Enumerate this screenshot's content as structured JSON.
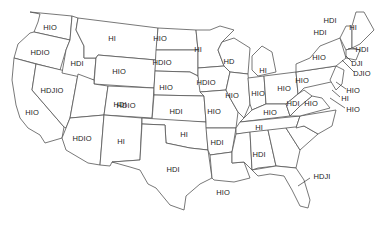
{
  "map": {
    "type": "US states choropleth-style label map",
    "states": [
      {
        "id": "WA",
        "label": "HIO",
        "x": 50,
        "y": 27
      },
      {
        "id": "OR",
        "label": "HDIO",
        "x": 40,
        "y": 52
      },
      {
        "id": "ID",
        "label": "HDI",
        "x": 77,
        "y": 63
      },
      {
        "id": "MT",
        "label": "HI",
        "x": 112,
        "y": 38
      },
      {
        "id": "WY",
        "label": "HIO",
        "x": 119,
        "y": 71
      },
      {
        "id": "ND",
        "label": "HIO",
        "x": 160,
        "y": 38
      },
      {
        "id": "SD",
        "label": "HDIO",
        "x": 162,
        "y": 62
      },
      {
        "id": "NE",
        "label": "HIO",
        "x": 166,
        "y": 87
      },
      {
        "id": "MN",
        "label": "HI",
        "x": 198,
        "y": 49
      },
      {
        "id": "WI",
        "label": "HD",
        "x": 229,
        "y": 61
      },
      {
        "id": "MI",
        "label": "HI",
        "x": 263,
        "y": 70
      },
      {
        "id": "IA",
        "label": "HDIO",
        "x": 206,
        "y": 82
      },
      {
        "id": "IL",
        "label": "HIO",
        "x": 232,
        "y": 95
      },
      {
        "id": "IN",
        "label": "HIO",
        "x": 258,
        "y": 93
      },
      {
        "id": "OH",
        "label": "HIO",
        "x": 284,
        "y": 88
      },
      {
        "id": "NV",
        "label": "HDJIO",
        "x": 52,
        "y": 90
      },
      {
        "id": "UT",
        "label": "HDI",
        "x": 120,
        "y": 104
      },
      {
        "id": "CO",
        "label": "HDIO",
        "x": 126,
        "y": 105
      },
      {
        "id": "KS",
        "label": "HDI",
        "x": 176,
        "y": 111
      },
      {
        "id": "MO",
        "label": "HIO",
        "x": 214,
        "y": 111
      },
      {
        "id": "KY",
        "label": "HIO",
        "x": 270,
        "y": 112
      },
      {
        "id": "CA",
        "label": "HIO",
        "x": 32,
        "y": 112
      },
      {
        "id": "AZ",
        "label": "HDIO",
        "x": 82,
        "y": 138
      },
      {
        "id": "NM",
        "label": "HI",
        "x": 121,
        "y": 141
      },
      {
        "id": "OK",
        "label": "HI",
        "x": 184,
        "y": 134
      },
      {
        "id": "TN",
        "label": "HI",
        "x": 259,
        "y": 127
      },
      {
        "id": "AR",
        "label": "HDI",
        "x": 217,
        "y": 142
      },
      {
        "id": "TX",
        "label": "HDI",
        "x": 173,
        "y": 169
      },
      {
        "id": "AL",
        "label": "HDI",
        "x": 259,
        "y": 154
      },
      {
        "id": "LA",
        "label": "HIO",
        "x": 223,
        "y": 192
      },
      {
        "id": "FL",
        "label": "HDJI",
        "x": 322,
        "y": 176
      },
      {
        "id": "PA",
        "label": "HIO",
        "x": 302,
        "y": 80
      },
      {
        "id": "NY",
        "label": "HIO",
        "x": 319,
        "y": 57
      },
      {
        "id": "WV",
        "label": "HDI",
        "x": 293,
        "y": 103
      },
      {
        "id": "VA",
        "label": "HIO",
        "x": 311,
        "y": 103
      },
      {
        "id": "ME",
        "label": "HI",
        "x": 353,
        "y": 27
      },
      {
        "id": "VT",
        "label": "HDI",
        "x": 330,
        "y": 20
      },
      {
        "id": "NH",
        "label": "HDI",
        "x": 320,
        "y": 32
      },
      {
        "id": "MA",
        "label": "HDI",
        "x": 362,
        "y": 49
      },
      {
        "id": "RI",
        "label": "DJI",
        "x": 357,
        "y": 63
      },
      {
        "id": "CT",
        "label": "DJIO",
        "x": 362,
        "y": 73
      },
      {
        "id": "NJ",
        "label": "HIO",
        "x": 353,
        "y": 90
      },
      {
        "id": "DE",
        "label": "HI",
        "x": 345,
        "y": 98
      },
      {
        "id": "MD",
        "label": "HIO",
        "x": 353,
        "y": 109
      }
    ]
  }
}
